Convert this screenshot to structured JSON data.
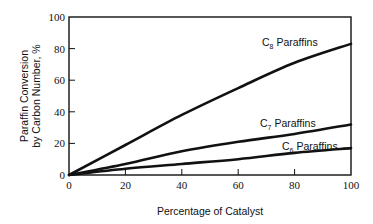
{
  "chart_data": {
    "type": "line",
    "title": "",
    "xlabel": "Percentage of Catalyst",
    "ylabel_line1": "Paraffin Conversion",
    "ylabel_line2": "by Carbon Number, %",
    "xlim": [
      0,
      100
    ],
    "ylim": [
      0,
      100
    ],
    "x_ticks": [
      0,
      20,
      40,
      60,
      80,
      100
    ],
    "y_ticks": [
      0,
      20,
      40,
      60,
      80,
      100
    ],
    "grid": false,
    "x": [
      0,
      20,
      40,
      60,
      80,
      100
    ],
    "series": [
      {
        "name": "C8 Paraffins",
        "label_base": "C",
        "label_sub": "8",
        "label_rest": " Paraffins",
        "values": [
          0,
          19,
          38,
          55,
          71,
          83
        ]
      },
      {
        "name": "C7 Paraffins",
        "label_base": "C",
        "label_sub": "7",
        "label_rest": " Paraffins",
        "values": [
          0,
          7,
          15,
          21,
          26,
          32
        ]
      },
      {
        "name": "C6 Paraffins",
        "label_base": "C",
        "label_sub": "6",
        "label_rest": " Paraffins",
        "values": [
          0,
          4,
          7,
          10,
          14,
          17
        ]
      }
    ],
    "legend": "inline labels near line ends"
  }
}
